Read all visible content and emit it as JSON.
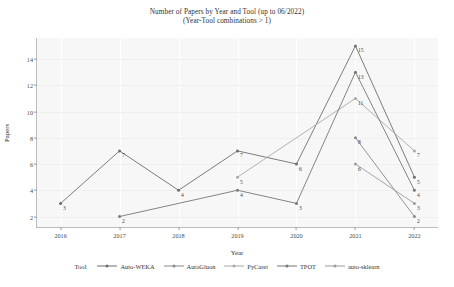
{
  "chart_data": {
    "type": "line",
    "title": "Number of Papers by Year and Tool (up to 06/2022)",
    "subtitle": "(Year-Tool combinations > 1)",
    "xlabel": "Year",
    "ylabel": "Papers",
    "x": [
      2016,
      2017,
      2018,
      2019,
      2020,
      2021,
      2022
    ],
    "xticklabels": [
      "2016",
      "2017",
      "2018",
      "2019",
      "2020",
      "2021",
      "2022"
    ],
    "yticks": [
      2,
      4,
      6,
      8,
      10,
      12,
      14
    ],
    "yticklabels": [
      "2",
      "4",
      "6",
      "8",
      "10",
      "12",
      "14"
    ],
    "ylim": [
      1.2,
      15.6
    ],
    "xlim": [
      2015.6,
      2022.4
    ],
    "grid": true,
    "legend_title": "Tool",
    "legend_position": "bottom",
    "series": [
      {
        "name": "Auto-WEKA",
        "color": "#6e6e6e",
        "points": [
          {
            "x": 2016,
            "y": 3,
            "label": "3"
          },
          {
            "x": 2017,
            "y": 7,
            "label": "7"
          },
          {
            "x": 2018,
            "y": 4,
            "label": "4"
          },
          {
            "x": 2019,
            "y": 7,
            "label": "7"
          },
          {
            "x": 2020,
            "y": 6,
            "label": "6"
          },
          {
            "x": 2021,
            "y": 15,
            "label": "15"
          },
          {
            "x": 2022,
            "y": 5,
            "label": "5"
          }
        ]
      },
      {
        "name": "AutoGluon",
        "color": "#8a8a8a",
        "points": [
          {
            "x": 2021,
            "y": 8,
            "label": "8"
          },
          {
            "x": 2022,
            "y": 2,
            "label": "2"
          }
        ]
      },
      {
        "name": "PyCaret",
        "color": "#a9a9a9",
        "points": [
          {
            "x": 2019,
            "y": 5,
            "label": "5"
          },
          {
            "x": 2021,
            "y": 11,
            "label": "11"
          },
          {
            "x": 2022,
            "y": 7,
            "label": "7"
          }
        ]
      },
      {
        "name": "TPOT",
        "color": "#777777",
        "points": [
          {
            "x": 2017,
            "y": 2,
            "label": "2"
          },
          {
            "x": 2019,
            "y": 4,
            "label": "4"
          },
          {
            "x": 2020,
            "y": 3,
            "label": "3"
          },
          {
            "x": 2021,
            "y": 13,
            "label": "13"
          },
          {
            "x": 2022,
            "y": 4,
            "label": "4"
          }
        ]
      },
      {
        "name": "auto-sklearn",
        "color": "#9c9c9c",
        "points": [
          {
            "x": 2021,
            "y": 6,
            "label": "6"
          },
          {
            "x": 2022,
            "y": 3,
            "label": "3"
          }
        ]
      }
    ]
  }
}
